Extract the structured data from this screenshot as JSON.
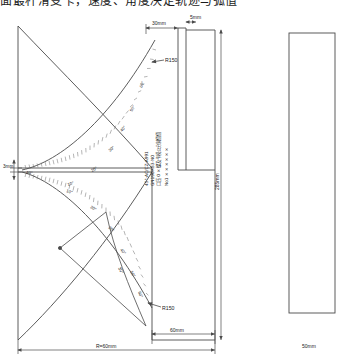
{
  "page": {
    "heading_partial": "面最杆滑变卡，速度、角度决定轨迹与弧值"
  },
  "drawing": {
    "title": "protractor-template-technical-drawing",
    "stroke_color": "#4a4a4a",
    "thin_color": "#8a8a8a",
    "text_color": "#222222",
    "dimensions": {
      "top_left": "30mm",
      "top_right": "5mm",
      "left_vertex": "3mm",
      "bottom_inner": "60mm",
      "bottom_overall": "R=60mm",
      "right_vertical": "285mm",
      "far_right_block": "50mm",
      "radius_upper": "R150",
      "radius_lower": "R150"
    },
    "angles": {
      "vertex_label": "40°",
      "inner_arc_label": "30°",
      "upper_ticks": [
        "10°",
        "20°",
        "30°",
        "40°",
        "50°",
        "60°"
      ],
      "lower_ticks": [
        "10°",
        "20°",
        "30°",
        "40°",
        "50°",
        "60°"
      ]
    },
    "center_notes": {
      "line1": "45°-AC/CZ-A991",
      "line2": "GN190RB3-N0",
      "line3": "口压 0 × 螺及卡模公分别值值",
      "line4": "No1 × × × × × ×"
    }
  }
}
